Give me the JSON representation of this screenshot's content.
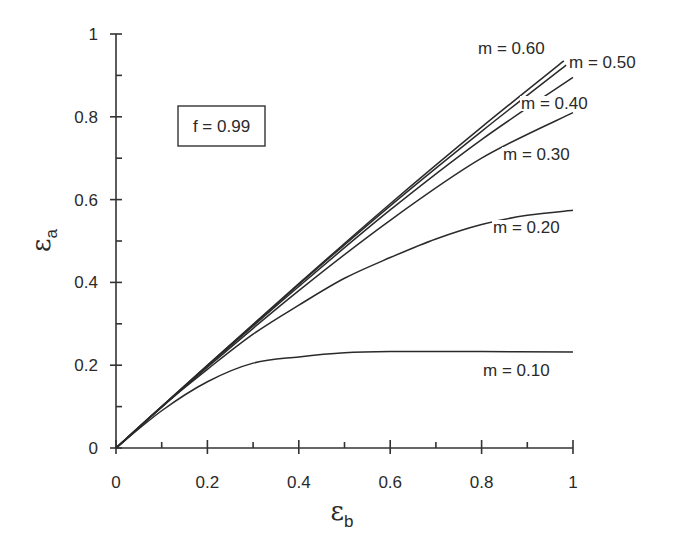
{
  "chart_data": {
    "type": "line",
    "title": "",
    "xlabel": "ε_b",
    "ylabel": "ε_a",
    "xlabel_symbol": "ε",
    "xlabel_sub": "b",
    "ylabel_symbol": "ε",
    "ylabel_sub": "a",
    "xlim": [
      0,
      1
    ],
    "ylim": [
      0,
      1
    ],
    "grid": false,
    "legend": "inline curve labels",
    "annotation": "f = 0.99",
    "x_ticks": [
      0,
      0.2,
      0.4,
      0.6,
      0.8,
      1
    ],
    "x_tick_labels": [
      "0",
      "0.2",
      "0.4",
      "0.6",
      "0.8",
      "1"
    ],
    "y_ticks": [
      0,
      0.2,
      0.4,
      0.6,
      0.8,
      1
    ],
    "y_tick_labels": [
      "0",
      "0.2",
      "0.4",
      "0.6",
      "0.8",
      "1"
    ],
    "x_minor_ticks": [
      0.1,
      0.3,
      0.5,
      0.7,
      0.9
    ],
    "y_minor_ticks": [
      0.1,
      0.3,
      0.5,
      0.7,
      0.9
    ],
    "series": [
      {
        "name": "m = 0.10",
        "x": [
          0,
          0.1,
          0.2,
          0.3,
          0.4,
          0.5,
          0.6,
          0.8,
          1.0
        ],
        "y": [
          0,
          0.09,
          0.16,
          0.205,
          0.22,
          0.23,
          0.233,
          0.233,
          0.232
        ]
      },
      {
        "name": "m = 0.20",
        "x": [
          0,
          0.1,
          0.2,
          0.3,
          0.4,
          0.5,
          0.6,
          0.7,
          0.8,
          0.9,
          1.0
        ],
        "y": [
          0,
          0.1,
          0.19,
          0.275,
          0.345,
          0.41,
          0.46,
          0.505,
          0.54,
          0.562,
          0.574
        ]
      },
      {
        "name": "m = 0.30",
        "x": [
          0,
          0.2,
          0.4,
          0.6,
          0.8,
          1.0
        ],
        "y": [
          0,
          0.195,
          0.38,
          0.55,
          0.7,
          0.81
        ]
      },
      {
        "name": "m = 0.40",
        "x": [
          0,
          0.2,
          0.4,
          0.6,
          0.8,
          1.0
        ],
        "y": [
          0,
          0.198,
          0.39,
          0.575,
          0.745,
          0.895
        ]
      },
      {
        "name": "m = 0.50",
        "x": [
          0,
          0.2,
          0.4,
          0.6,
          0.8,
          0.985
        ],
        "y": [
          0,
          0.2,
          0.395,
          0.585,
          0.765,
          0.925
        ]
      },
      {
        "name": "m = 0.60",
        "x": [
          0,
          0.2,
          0.4,
          0.6,
          0.8,
          0.98
        ],
        "y": [
          0,
          0.2,
          0.397,
          0.59,
          0.775,
          0.935
        ]
      }
    ],
    "curve_labels": [
      {
        "text": "m = 0.60",
        "px": 478,
        "py": 54
      },
      {
        "text": "m = 0.50",
        "px": 569,
        "py": 68
      },
      {
        "text": "m = 0.40",
        "px": 521,
        "py": 109
      },
      {
        "text": "m = 0.30",
        "px": 503,
        "py": 160
      },
      {
        "text": "m = 0.20",
        "px": 493,
        "py": 233
      },
      {
        "text": "m = 0.10",
        "px": 483,
        "py": 376
      }
    ]
  },
  "layout": {
    "plot_left": 116,
    "plot_right": 573,
    "plot_top": 34,
    "plot_bottom": 448,
    "annot_box": {
      "x": 178,
      "y": 106,
      "w": 87,
      "h": 40
    },
    "colors": {
      "line": "#2a2a2a",
      "background": "#ffffff"
    }
  }
}
